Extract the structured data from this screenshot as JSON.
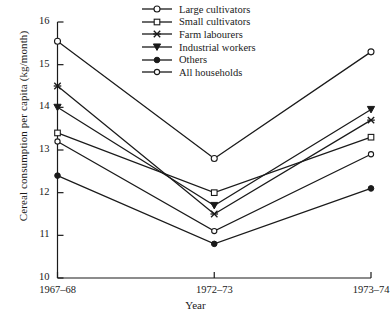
{
  "chart_data": {
    "type": "line",
    "title": "",
    "xlabel": "Year",
    "ylabel": "Cereal consumption per capita (kg/month)",
    "categories": [
      "1967–68",
      "1972–73",
      "1973–74"
    ],
    "xticklabels": [
      "1967–68",
      "1972–73",
      "1973–74"
    ],
    "yticklabels": [
      "10",
      "11",
      "12",
      "13",
      "14",
      "15",
      "16"
    ],
    "yticks": [
      10,
      11,
      12,
      13,
      14,
      15,
      16
    ],
    "ylim": [
      10,
      16
    ],
    "grid": false,
    "legend_position": "top-center",
    "series": [
      {
        "name": "Large cultivators",
        "marker": "open-circle",
        "values": [
          15.55,
          12.8,
          15.3
        ]
      },
      {
        "name": "Small cultivators",
        "marker": "open-square",
        "values": [
          13.4,
          12.0,
          13.3
        ]
      },
      {
        "name": "Farm labourers",
        "marker": "cross-star",
        "values": [
          14.5,
          11.5,
          13.7
        ]
      },
      {
        "name": "Industrial workers",
        "marker": "down-triangle",
        "values": [
          14.0,
          11.7,
          13.95
        ]
      },
      {
        "name": "Others",
        "marker": "filled-circle",
        "values": [
          12.4,
          10.8,
          12.1
        ]
      },
      {
        "name": "All households",
        "marker": "open-circle-sm",
        "values": [
          13.2,
          11.1,
          12.9
        ]
      }
    ]
  },
  "axis": {
    "ylabel": "Cereal consumption per capita (kg/month)",
    "xlabel": "Year",
    "yticklabels": [
      "16",
      "15",
      "14",
      "13",
      "12",
      "11",
      "10"
    ],
    "xticklabels": [
      "1967–68",
      "1972–73",
      "1973–74"
    ]
  },
  "legend": {
    "items": [
      {
        "label": "Large cultivators",
        "marker": "open-circle"
      },
      {
        "label": "Small cultivators",
        "marker": "open-square"
      },
      {
        "label": "Farm labourers",
        "marker": "cross-star"
      },
      {
        "label": "Industrial workers",
        "marker": "down-triangle"
      },
      {
        "label": "Others",
        "marker": "filled-circle"
      },
      {
        "label": "All households",
        "marker": "open-circle-sm"
      }
    ]
  },
  "colors": {
    "ink": "#1a1a1a",
    "background": "#ffffff"
  }
}
